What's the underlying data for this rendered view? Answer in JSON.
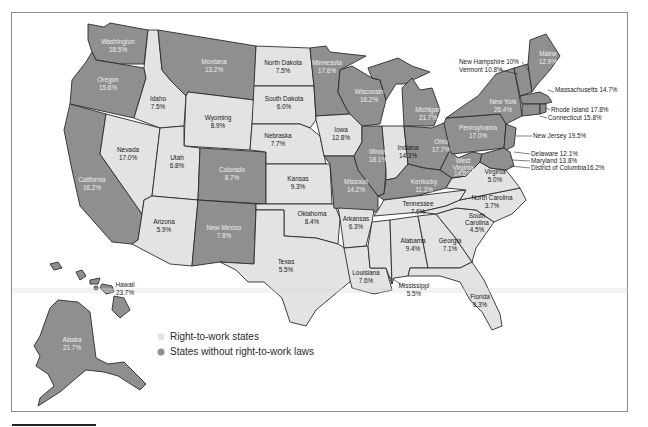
{
  "legend": {
    "items": [
      {
        "label": "Right-to-work states",
        "color": "#e3e3e3"
      },
      {
        "label": "States without right-to-work laws",
        "color": "#8f8f8f"
      }
    ]
  },
  "colors": {
    "right_to_work": "#e3e3e3",
    "non_right_to_work": "#8f8f8f",
    "border": "#2b2b2b"
  },
  "states": {
    "washington": {
      "name": "Washington",
      "value": "18.5%",
      "rtw": false
    },
    "oregon": {
      "name": "Oregon",
      "value": "15.6%",
      "rtw": false
    },
    "california": {
      "name": "California",
      "value": "16.2%",
      "rtw": false
    },
    "idaho": {
      "name": "Idaho",
      "value": "7.5%",
      "rtw": true
    },
    "nevada": {
      "name": "Nevada",
      "value": "17.0%",
      "rtw": true
    },
    "montana": {
      "name": "Montana",
      "value": "13.2%",
      "rtw": false
    },
    "wyoming": {
      "name": "Wyoming",
      "value": "8.9%",
      "rtw": true
    },
    "utah": {
      "name": "Utah",
      "value": "6.8%",
      "rtw": true
    },
    "colorado": {
      "name": "Colorado",
      "value": "8.7%",
      "rtw": false
    },
    "arizona": {
      "name": "Arizona",
      "value": "5.9%",
      "rtw": true
    },
    "new_mexico": {
      "name": "New Mexico",
      "value": "7.8%",
      "rtw": false
    },
    "north_dakota": {
      "name": "North Dakota",
      "value": "7.5%",
      "rtw": true
    },
    "south_dakota": {
      "name": "South Dakota",
      "value": "6.0%",
      "rtw": true
    },
    "nebraska": {
      "name": "Nebraska",
      "value": "7.7%",
      "rtw": true
    },
    "kansas": {
      "name": "Kansas",
      "value": "9.3%",
      "rtw": true
    },
    "oklahoma": {
      "name": "Oklahoma",
      "value": "8.4%",
      "rtw": true
    },
    "texas": {
      "name": "Texas",
      "value": "5.5%",
      "rtw": true
    },
    "minnesota": {
      "name": "Minnesota",
      "value": "17.6%",
      "rtw": false
    },
    "iowa": {
      "name": "Iowa",
      "value": "12.8%",
      "rtw": true
    },
    "missouri": {
      "name": "Missouri",
      "value": "14.2%",
      "rtw": false
    },
    "arkansas": {
      "name": "Arkansas",
      "value": "6.3%",
      "rtw": true
    },
    "louisiana": {
      "name": "Louisiana",
      "value": "7.6%",
      "rtw": true
    },
    "wisconsin": {
      "name": "Wisconsin",
      "value": "16.2%",
      "rtw": false
    },
    "illinois": {
      "name": "Illinois",
      "value": "18.1%",
      "rtw": false
    },
    "michigan": {
      "name": "Michigan",
      "value": "21.7%",
      "rtw": false
    },
    "indiana": {
      "name": "Indiana",
      "value": "14.3%",
      "rtw": true
    },
    "ohio": {
      "name": "Ohio",
      "value": "17.7%",
      "rtw": false
    },
    "kentucky": {
      "name": "Kentucky",
      "value": "11.3%",
      "rtw": false
    },
    "tennessee": {
      "name": "Tennessee",
      "value": "7.6%",
      "rtw": true
    },
    "mississippi": {
      "name": "Mississippi",
      "value": "5.5%",
      "rtw": true
    },
    "alabama": {
      "name": "Alabama",
      "value": "9.4%",
      "rtw": true
    },
    "georgia": {
      "name": "Georgia",
      "value": "7.1%",
      "rtw": true
    },
    "florida": {
      "name": "Florida",
      "value": "6.3%",
      "rtw": true
    },
    "south_carolina": {
      "name_line1": "South",
      "name_line2": "Carolina",
      "value": "4.5%",
      "rtw": true
    },
    "north_carolina": {
      "name": "North Carolina",
      "value": "3.7%",
      "rtw": true
    },
    "virginia": {
      "name": "Virginia",
      "value": "5.0%",
      "rtw": true
    },
    "west_virginia": {
      "name_line1": "West",
      "name_line2": "Virginia",
      "value": "14.6%",
      "rtw": false
    },
    "pennsylvania": {
      "name": "Pennsylvania",
      "value": "17.0%",
      "rtw": false
    },
    "new_york": {
      "name": "New York",
      "value": "26.4%",
      "rtw": false
    },
    "maine": {
      "name": "Maine",
      "value": "12.9%",
      "rtw": false
    },
    "alaska": {
      "name": "Alaska",
      "value": "21.7%",
      "rtw": false
    },
    "hawaii": {
      "name": "Hawaii",
      "value": "23.7%",
      "rtw": false
    }
  },
  "callouts": {
    "new_hampshire": "New Hampshire 10%",
    "vermont": "Vermont 10.8%",
    "massachusetts": "Massachusetts 14.7%",
    "rhode_island": "Rhode Island 17.8%",
    "connecticut": "Connecticut 15.8%",
    "new_jersey": "New Jersey 19.5%",
    "delaware": "Delaware 12.1%",
    "maryland": "Maryland 13.8%",
    "dc": "District of Columbia16.2%"
  }
}
